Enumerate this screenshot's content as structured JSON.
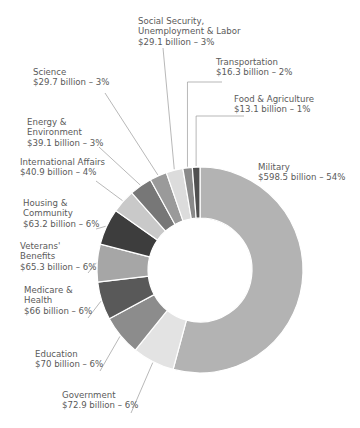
{
  "chart_data": {
    "type": "pie",
    "subtype": "donut",
    "unit": "billion USD",
    "start_angle": "12 o'clock, clockwise",
    "categories": [
      "Military",
      "Government",
      "Education",
      "Medicare & Health",
      "Veterans' Benefits",
      "Housing & Community",
      "International Affairs",
      "Energy & Environment",
      "Science",
      "Social Security, Unemployment & Labor",
      "Transportation",
      "Food & Agriculture"
    ],
    "values": [
      598.5,
      72.9,
      70,
      66,
      65.3,
      63.2,
      40.9,
      39.1,
      29.7,
      29.1,
      16.3,
      13.1
    ],
    "percents": [
      54,
      6,
      6,
      6,
      6,
      6,
      4,
      3,
      3,
      3,
      2,
      1
    ],
    "colors": [
      "#b3b3b3",
      "#e3e3e3",
      "#8c8c8c",
      "#595959",
      "#a6a6a6",
      "#3d3d3d",
      "#c9c9c9",
      "#777777",
      "#9a9a9a",
      "#dcdcdc",
      "#8a8a8a",
      "#505050"
    ]
  },
  "labels": [
    {
      "name": "military",
      "lines": [
        "Military",
        "$598.5 billion – 54%"
      ]
    },
    {
      "name": "government",
      "lines": [
        "Government",
        "$72.9 billion – 6%"
      ]
    },
    {
      "name": "education",
      "lines": [
        "Education",
        "$70 billion – 6%"
      ]
    },
    {
      "name": "medicare",
      "lines": [
        "Medicare &",
        "Health",
        "$66 billion – 6%"
      ]
    },
    {
      "name": "veterans",
      "lines": [
        "Veterans'",
        "Benefits",
        "$65.3 billion – 6%"
      ]
    },
    {
      "name": "housing",
      "lines": [
        "Housing &",
        "Community",
        "$63.2 billion – 6%"
      ]
    },
    {
      "name": "international",
      "lines": [
        "International Affairs",
        "$40.9 billion – 4%"
      ]
    },
    {
      "name": "energy",
      "lines": [
        "Energy &",
        "Environment",
        "$39.1 billion – 3%"
      ]
    },
    {
      "name": "science",
      "lines": [
        "Science",
        "$29.7 billion – 3%"
      ]
    },
    {
      "name": "social-security",
      "lines": [
        "Social Security,",
        "Unemployment & Labor",
        "$29.1 billion – 3%"
      ]
    },
    {
      "name": "transportation",
      "lines": [
        "Transportation",
        "$16.3 billion – 2%"
      ]
    },
    {
      "name": "food",
      "lines": [
        "Food & Agriculture",
        "$13.1 billion – 1%"
      ]
    }
  ]
}
